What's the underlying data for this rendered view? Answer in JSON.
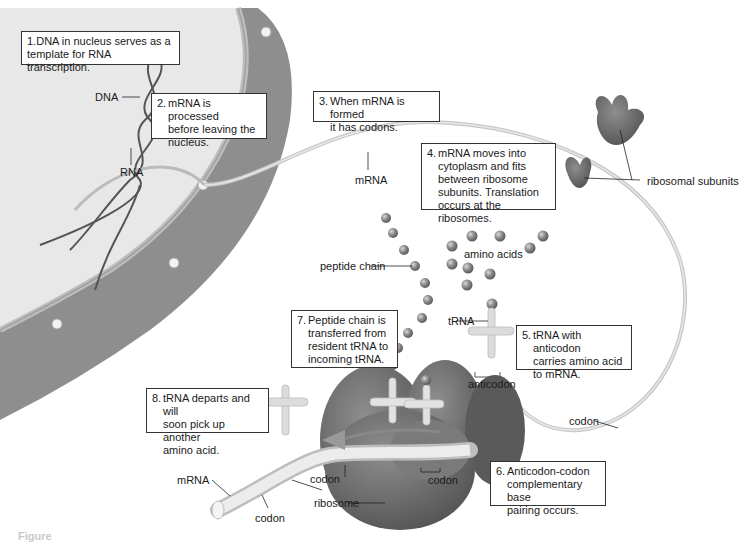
{
  "figure": {
    "caption_partial": "Figure"
  },
  "steps": [
    {
      "num": "1.",
      "text": "DNA in nucleus serves as a\ntemplate for RNA transcription."
    },
    {
      "num": "2.",
      "text": "mRNA is processed\nbefore leaving the\nnucleus."
    },
    {
      "num": "3.",
      "text": "When mRNA is formed\nit has codons."
    },
    {
      "num": "4.",
      "text": "mRNA moves into\ncytoplasm and fits\nbetween ribosome\nsubunits. Translation\noccurs at the ribosomes."
    },
    {
      "num": "5.",
      "text": "tRNA with anticodon\ncarries amino acid\nto mRNA."
    },
    {
      "num": "6.",
      "text": "Anticodon-codon\ncomplementary base\npairing occurs."
    },
    {
      "num": "7.",
      "text": "Peptide chain is\ntransferred from\nresident tRNA to\nincoming tRNA."
    },
    {
      "num": "8.",
      "text": "tRNA departs and will\nsoon pick up another\namino acid."
    }
  ],
  "labels": {
    "dna": "DNA",
    "rna": "RNA",
    "mrna_top": "mRNA",
    "ribosomal_subunits": "ribosomal subunits",
    "amino_acids": "amino acids",
    "peptide_chain": "peptide chain",
    "trna": "tRNA",
    "anticodon": "anticodon",
    "codon_right": "codon",
    "codon_ribosome": "codon",
    "codon_mid": "codon",
    "codon_bottom": "codon",
    "mrna_bottom": "mRNA",
    "ribosome": "ribosome"
  },
  "colors": {
    "nucleus_interior": "#e6e6e6",
    "nuclear_envelope": "#8c8c8c",
    "ribosome": "#6e6e6e",
    "mrna_strand": "#cfcfcf",
    "amino_acid": "#8a8a8a",
    "trna": "#dcdcdc"
  }
}
